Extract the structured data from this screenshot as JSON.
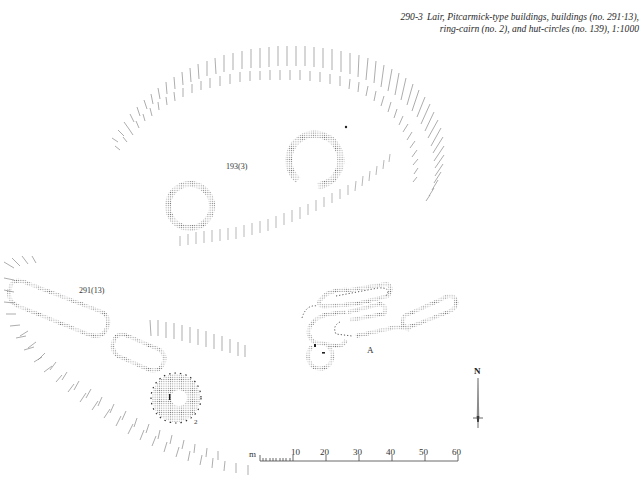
{
  "figure": {
    "number": "290-3",
    "caption_line1": "Lair, Pitcarmick-type buildings, buildings (no. 291·13),",
    "caption_line2": "ring-cairn (no. 2), and hut-circles (no. 139), 1:1000"
  },
  "labels": {
    "hut_circles": "193(3)",
    "buildings": "291(13)",
    "ring_cairn": "2",
    "site_a": "A",
    "north": "N"
  },
  "scale_bar": {
    "unit": "m",
    "ticks": [
      "10",
      "20",
      "30",
      "40",
      "50",
      "60"
    ]
  },
  "colors": {
    "ink": "#444444",
    "hachure": "#8a8a8a",
    "background": "#ffffff"
  }
}
